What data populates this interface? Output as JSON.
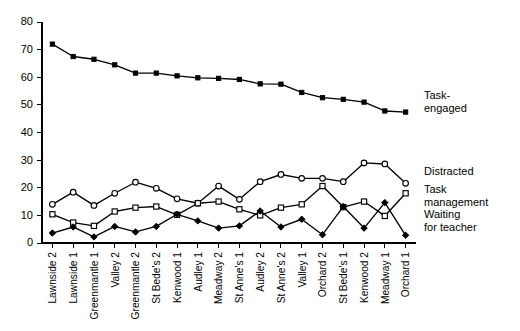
{
  "chart_data": {
    "type": "line",
    "title": "",
    "subtitle": "",
    "xlabel": "",
    "ylabel": "",
    "ylim": [
      0,
      80
    ],
    "yticks": [
      0,
      10,
      20,
      30,
      40,
      50,
      60,
      70,
      80
    ],
    "grid": false,
    "legend_position": "right",
    "categories": [
      "Lawnside 2",
      "Lawnside 1",
      "Greenmantle 1",
      "Valley 2",
      "Greenmantle 2",
      "St Bede's 2",
      "Kenwood 1",
      "Audley 1",
      "Meadway 2",
      "St Anne's 1",
      "Audley 2",
      "St Anne's 2",
      "Valley 1",
      "Orchard 2",
      "St Bede's 1",
      "Kenwood 2",
      "Meadway 1",
      "Orchard 1"
    ],
    "series": [
      {
        "name": "Task-engaged",
        "marker": "filled-square",
        "values": [
          72,
          67.5,
          66.5,
          64.5,
          61.5,
          61.5,
          60.5,
          59.8,
          59.6,
          59.2,
          57.6,
          57.5,
          54.5,
          52.6,
          52,
          51,
          47.8,
          47.4
        ]
      },
      {
        "name": "Distracted",
        "marker": "open-circle",
        "values": [
          14,
          18.4,
          13.6,
          18,
          22,
          19.8,
          16,
          14.4,
          20.6,
          15.8,
          22.2,
          24.8,
          23.4,
          23.4,
          22.2,
          29,
          28.6,
          21.6
        ]
      },
      {
        "name": "Task management",
        "marker": "open-square",
        "values": [
          10.4,
          7.4,
          6.2,
          11.4,
          12.8,
          13.2,
          10.2,
          14.4,
          15,
          12.2,
          10,
          12.8,
          14,
          20.6,
          13,
          15,
          9.8,
          18
        ]
      },
      {
        "name": "Waiting for teacher",
        "marker": "filled-diamond",
        "values": [
          3.6,
          5.8,
          2.2,
          6,
          4,
          6,
          10.4,
          8,
          5.4,
          6.2,
          11.6,
          5.8,
          8.6,
          3,
          13.2,
          5.4,
          14.6,
          2.8
        ]
      }
    ],
    "legend": [
      {
        "label_line1": "Task-",
        "label_line2": "engaged"
      },
      {
        "label_line1": "Distracted",
        "label_line2": ""
      },
      {
        "label_line1": "Task",
        "label_line2": "management"
      },
      {
        "label_line1": "Waiting",
        "label_line2": "for teacher"
      }
    ],
    "colors": {
      "line": "#000000",
      "marker_fill": "#000000",
      "marker_open": "#ffffff",
      "axis": "#000000",
      "background": "#ffffff"
    }
  }
}
